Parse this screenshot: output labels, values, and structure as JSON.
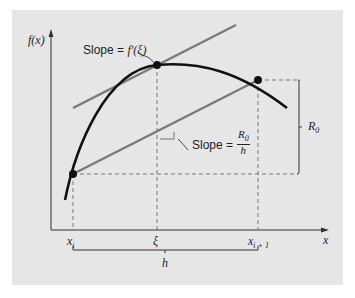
{
  "figure": {
    "y_axis_label": "f(x)",
    "x_axis_label": "x",
    "x_ticks": [
      {
        "name": "xi",
        "base": "x",
        "sub": "i"
      },
      {
        "name": "xi",
        "base": "ξ",
        "sub": ""
      },
      {
        "name": "xi+1",
        "base": "x",
        "sub": "i + 1"
      }
    ],
    "brace_label": "h",
    "tangent_annotation": {
      "prefix": "Slope = ",
      "expr": "f′(ξ)"
    },
    "secant_annotation": {
      "prefix": "Slope = ",
      "numerator": "R",
      "numerator_sub": "0",
      "denominator": "h"
    },
    "vertical_span_label": {
      "base": "R",
      "sub": "0"
    },
    "colors": {
      "background_panel": "#e6e6e6",
      "curve": "#111111",
      "tangent_line": "#7a7a7a",
      "secant_line": "#7a7a7a",
      "dashed_guides": "#777777",
      "axes": "#333333"
    }
  }
}
